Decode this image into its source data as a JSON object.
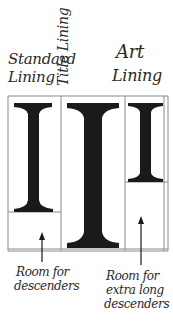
{
  "columns": [
    {
      "label_line1": "Standard",
      "label_line2": "Lining",
      "glyph": "I"
    },
    {
      "label": "Title Lining",
      "glyph": "I"
    },
    {
      "label_line1": "Art",
      "label_line2": "Lining",
      "glyph": "I"
    }
  ],
  "annotations": [
    {
      "line1": "Room for",
      "line2": "descenders"
    },
    {
      "line1": "Room for",
      "line2": "extra long",
      "line3": "descenders"
    }
  ],
  "colors": {
    "ink": "#1a1a1a",
    "rule": "#8a8a8a",
    "paper": "#ffffff"
  }
}
